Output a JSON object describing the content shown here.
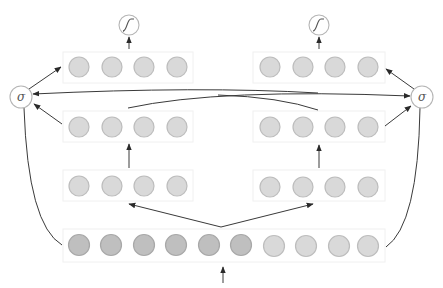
{
  "colors": {
    "neuron_fill": "#d9d9d9",
    "neuron_stroke": "#bdbdbd",
    "neuron_dark_fill": "#bfbfbf",
    "neuron_dark_stroke": "#a8a8a8",
    "edge": "#3a3a3a",
    "gate_stroke": "#b5b5b5"
  },
  "gates": {
    "left_sigma": {
      "label": "σ",
      "icon": "sigma-gate-icon"
    },
    "right_sigma": {
      "label": "σ",
      "icon": "sigma-gate-icon"
    },
    "left_output": {
      "icon": "sigmoid-curve-icon"
    },
    "right_output": {
      "icon": "sigmoid-curve-icon"
    }
  },
  "layers": {
    "input": {
      "neurons": 10,
      "dark_neurons": 6
    },
    "left_tower": {
      "hidden1": 4,
      "hidden2": 4,
      "output": 4
    },
    "right_tower": {
      "hidden1": 4,
      "hidden2": 4,
      "output": 4
    }
  }
}
